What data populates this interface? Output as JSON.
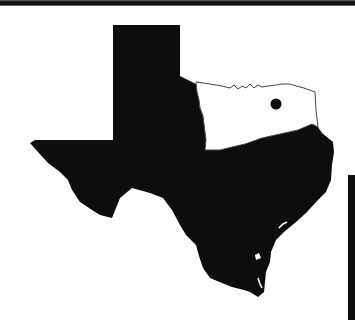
{
  "figure": {
    "regions": [
      {
        "name": "Texas",
        "fill": "#0d0d0d",
        "style": "solid silhouette"
      },
      {
        "name": "Oklahoma",
        "fill": "#ffffff",
        "style": "outlined"
      }
    ],
    "marker": {
      "type": "dot",
      "region": "Oklahoma",
      "color": "#0d0d0d"
    },
    "colors": {
      "background": "#ffffff",
      "ink": "#0d0d0d",
      "outline": "#444444"
    }
  }
}
